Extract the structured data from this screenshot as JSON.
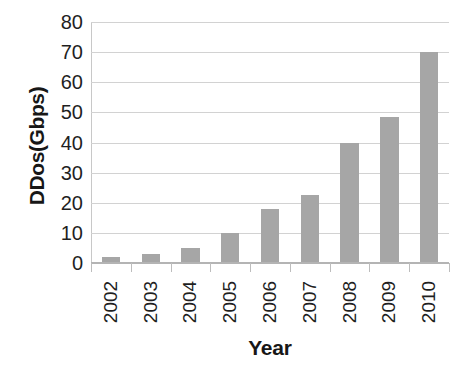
{
  "chart_data": {
    "type": "bar",
    "title": "",
    "categories": [
      "2002",
      "2003",
      "2004",
      "2005",
      "2006",
      "2007",
      "2008",
      "2009",
      "2010"
    ],
    "values": [
      2,
      3,
      5,
      10,
      18,
      22.5,
      40,
      48.5,
      70
    ],
    "xlabel": "Year",
    "ylabel": "DDos(Gbps)",
    "ylim": [
      0,
      80
    ],
    "ytick_labels": [
      "80",
      "70",
      "60",
      "50",
      "40",
      "30",
      "20",
      "10",
      "0"
    ],
    "ytick_values": [
      80,
      70,
      60,
      50,
      40,
      30,
      20,
      10,
      0
    ],
    "ytick_step": 10,
    "grid": "horizontal",
    "legend": "none",
    "bar_color": "#a6a6a6",
    "grid_color": "#d2d2d2",
    "axis_color": "#b4b4b4",
    "text_color": "#1f1f1f",
    "background_color": "#ffffff"
  }
}
